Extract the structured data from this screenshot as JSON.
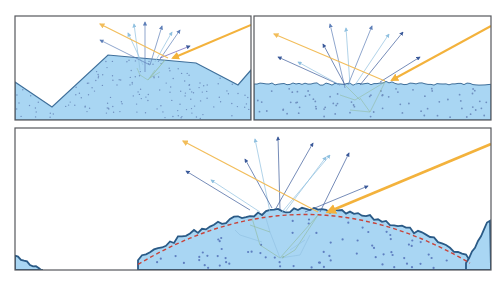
{
  "figure": {
    "colors": {
      "background": "#ffffff",
      "panel_border": "#55585c",
      "material_fill": "#a9d6f3",
      "surface_line": "#3f6f9a",
      "bold_surface_line": "#2a5a86",
      "particle_dot": "#6f8fbf",
      "incident_beam": "#f3b23c",
      "specular_beam": "#f2bd5a",
      "ray_dark": "#3b5a9a",
      "ray_mid": "#5e7fb8",
      "ray_light": "#8fc0e0",
      "subsurface_ray": "#8fb89a",
      "macro_surface_dashed": "#c8433a"
    },
    "panels": [
      {
        "id": "faceted-surface",
        "surface": "large facets"
      },
      {
        "id": "micro-rough-surface",
        "surface": "flat with micro roughness"
      },
      {
        "id": "curved-rough-surface",
        "surface": "curved with micro roughness and dashed macro profile"
      }
    ]
  }
}
